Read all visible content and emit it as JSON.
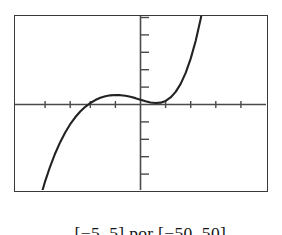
{
  "figure": {
    "caption_full": "[−5, 5] por [−50, 50]",
    "caption_x_interval": "[−5, 5]",
    "caption_connector": "por",
    "caption_y_interval": "[−50, 50]",
    "frame_color": "#3a3a3a",
    "curve_color": "#222222",
    "axis_color": "#4a4a4a",
    "background_color": "#ffffff"
  },
  "chart_data": {
    "type": "line",
    "title": "",
    "subtitle": "",
    "xlabel": "",
    "ylabel": "",
    "xlim": [
      -5,
      5
    ],
    "ylim": [
      -50,
      50
    ],
    "grid": false,
    "legend": null,
    "legend_position": "none",
    "x_tick_step": 1,
    "y_tick_step": 10,
    "x_ticks": [
      -5,
      -4,
      -3,
      -2,
      -1,
      0,
      1,
      2,
      3,
      4,
      5
    ],
    "y_ticks": [
      -50,
      -40,
      -30,
      -20,
      -10,
      0,
      10,
      20,
      30,
      40,
      50
    ],
    "x_tick_labels": [
      "",
      "",
      "",
      "",
      "",
      "",
      "",
      "",
      "",
      "",
      ""
    ],
    "y_tick_labels": [
      "",
      "",
      "",
      "",
      "",
      "",
      "",
      "",
      "",
      "",
      ""
    ],
    "annotations": [],
    "series": [
      {
        "name": "cubic",
        "comment": "y = 2(x+3)(x+1)(x-1)^2 style cubic sampled across the window",
        "x": [
          -5.0,
          -4.8,
          -4.6,
          -4.4,
          -4.2,
          -4.0,
          -3.8,
          -3.6,
          -3.4,
          -3.2,
          -3.0,
          -2.8,
          -2.6,
          -2.4,
          -2.2,
          -2.0,
          -1.8,
          -1.6,
          -1.4,
          -1.2,
          -1.0,
          -0.8,
          -0.6,
          -0.4,
          -0.2,
          0.0,
          0.2,
          0.4,
          0.6,
          0.8,
          1.0,
          1.2,
          1.4,
          1.6,
          1.8,
          2.0,
          2.2,
          2.4,
          2.6,
          2.8,
          3.0
        ],
        "y": [
          -124.0,
          -107.0,
          -92.0,
          -78.0,
          -66.0,
          -55.0,
          -45.0,
          -36.5,
          -29.0,
          -22.5,
          -17.0,
          -12.2,
          -8.2,
          -4.9,
          -2.2,
          0.0,
          1.7,
          3.0,
          3.9,
          4.4,
          4.6,
          4.5,
          4.2,
          3.6,
          2.8,
          1.9,
          1.0,
          0.3,
          0.0,
          0.2,
          1.2,
          3.2,
          6.4,
          11.0,
          17.3,
          25.5,
          35.8,
          48.5,
          63.8,
          82.0,
          103.0
        ],
        "key_points": {
          "x_intercepts": [
            -2.0,
            0.65
          ],
          "local_maximum": {
            "x": -1.05,
            "y": 4.6
          },
          "local_minimum": {
            "x": 0.65,
            "y": 0.0
          },
          "enters_window_bottom_left_at_x": -4.45,
          "exits_window_top_right_at_x": 2.55
        }
      }
    ]
  },
  "plot_geometry": {
    "frame": {
      "x": 14,
      "y": 15,
      "width": 254,
      "height": 177
    },
    "x_axis_y": 104,
    "y_axis_x": 140,
    "tick_length": 7,
    "x_tick_pixels": [
      45,
      90,
      190,
      238
    ],
    "y_tick_spacing_px": 17
  }
}
